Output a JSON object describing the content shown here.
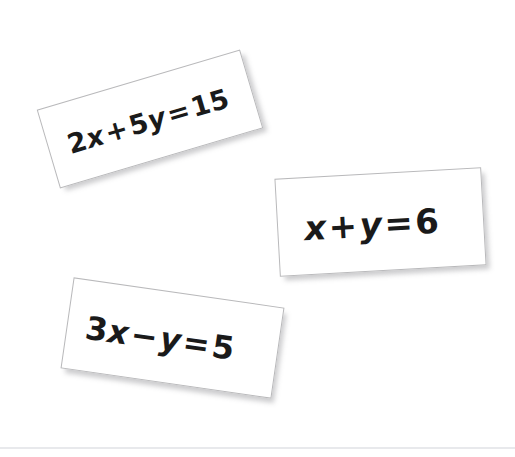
{
  "background_color": "#ffffff",
  "card_border_color": "#b9b9bb",
  "text_color": "#1a1a1a",
  "rule_color": "#e8e9ec",
  "cards": [
    {
      "id": "equation-card-1",
      "equation": "2x + 5y = 15",
      "coefficient_x": "2",
      "var_x": "x",
      "operator": "+",
      "coefficient_y": "5",
      "var_y": "y",
      "equals": "=",
      "constant": "15",
      "rotation_deg": -16.5
    },
    {
      "id": "equation-card-2",
      "equation": "x + y = 6",
      "coefficient_x": "",
      "var_x": "x",
      "operator": "+",
      "coefficient_y": "",
      "var_y": "y",
      "equals": "=",
      "constant": "6",
      "rotation_deg": -3.2
    },
    {
      "id": "equation-card-3",
      "equation": "3x − y = 5",
      "coefficient_x": "3",
      "var_x": "x",
      "operator": "−",
      "coefficient_y": "",
      "var_y": "y",
      "equals": "=",
      "constant": "5",
      "rotation_deg": 8.2
    }
  ]
}
